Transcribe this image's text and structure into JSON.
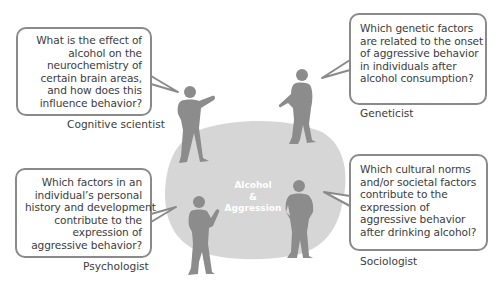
{
  "center": {
    "lines": [
      "Alcohol",
      "&",
      "Aggression"
    ],
    "blob_color": "#d6d6d6",
    "text_color": "#ffffff"
  },
  "colors": {
    "figure": "#8c8c8c",
    "bubble_border": "#8a8a8a",
    "text": "#3c3c3c"
  },
  "perspectives": [
    {
      "role": "Cognitive scientist",
      "question_lines": [
        "What is the effect of",
        "alcohol on the",
        "neurochemistry of",
        "certain brain areas,",
        "and how does this",
        "influence behavior?"
      ],
      "position": "top-left"
    },
    {
      "role": "Geneticist",
      "question_lines": [
        "Which genetic factors",
        "are related to the onset",
        "of aggressive behavior",
        "in individuals after",
        "alcohol consumption?"
      ],
      "position": "top-right"
    },
    {
      "role": "Psychologist",
      "question_lines": [
        "Which factors in an",
        "individual’s personal",
        "history and development",
        "contribute to the",
        "expression of",
        "aggressive behavior?"
      ],
      "position": "bottom-left"
    },
    {
      "role": "Sociologist",
      "question_lines": [
        "Which cultural norms",
        "and/or societal factors",
        "contribute to the",
        "expression of",
        "aggressive behavior",
        "after drinking alcohol?"
      ],
      "position": "bottom-right"
    }
  ]
}
